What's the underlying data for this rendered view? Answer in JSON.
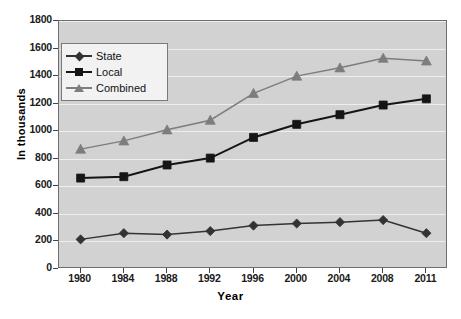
{
  "chart_data": {
    "type": "line",
    "title": "",
    "xlabel": "Year",
    "ylabel": "In thousands",
    "categories": [
      "1980",
      "1984",
      "1988",
      "1992",
      "1996",
      "2000",
      "2004",
      "2008",
      "2011"
    ],
    "x_tick_labels": [
      "1980",
      "1984",
      "1988",
      "1992",
      "1996",
      "2000",
      "2004",
      "2008",
      "2011"
    ],
    "y_tick_labels": [
      "0",
      "200",
      "400",
      "600",
      "800",
      "1000",
      "1200",
      "1400",
      "1600",
      "1800"
    ],
    "y_ticks": [
      0,
      200,
      400,
      600,
      800,
      1000,
      1200,
      1400,
      1600,
      1800
    ],
    "ylim": [
      0,
      1800
    ],
    "grid": true,
    "legend_position": "upper-left-inside",
    "series": [
      {
        "name": "State",
        "marker": "diamond",
        "color": "#333333",
        "values": [
          215,
          260,
          250,
          275,
          315,
          330,
          340,
          355,
          260
        ]
      },
      {
        "name": "Local",
        "marker": "square",
        "color": "#151515",
        "values": [
          660,
          670,
          755,
          805,
          955,
          1050,
          1120,
          1190,
          1235
        ]
      },
      {
        "name": "Combined",
        "marker": "triangle",
        "color": "#7d7d7d",
        "values": [
          870,
          930,
          1010,
          1080,
          1275,
          1400,
          1460,
          1530,
          1510
        ]
      }
    ]
  },
  "colors": {
    "plot_background": "#d2d2d2",
    "page_background": "#ffffff",
    "gridline": "#eeeeee",
    "axis": "#6e6e6e",
    "state": "#333333",
    "local": "#151515",
    "combined": "#7d7d7d",
    "legend_background": "#f2f2f2"
  },
  "legend": {
    "items": [
      {
        "label": "State"
      },
      {
        "label": "Local"
      },
      {
        "label": "Combined"
      }
    ]
  }
}
